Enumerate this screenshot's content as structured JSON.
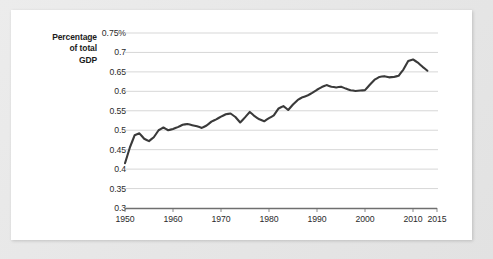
{
  "chart_data": {
    "type": "line",
    "title": "",
    "xlabel": "",
    "ylabel": "Percentage of total GDP",
    "ylabel_lines": [
      "Percentage",
      "of total",
      "GDP"
    ],
    "grid": true,
    "legend": "none",
    "xlim": [
      1950,
      2015
    ],
    "ylim": [
      0.3,
      0.75
    ],
    "x_ticks": [
      1950,
      1960,
      1970,
      1980,
      1990,
      2000,
      2010,
      2015
    ],
    "x_tick_labels": [
      "1950",
      "1960",
      "1970",
      "1980",
      "1990",
      "2000",
      "2010",
      "2015"
    ],
    "y_ticks": [
      0.3,
      0.35,
      0.4,
      0.45,
      0.5,
      0.55,
      0.6,
      0.65,
      0.7,
      0.75
    ],
    "y_tick_labels": [
      "0.3",
      "0.35",
      "0.4",
      "0.45",
      "0.5",
      "0.55",
      "0.6",
      "0.65",
      "0.7",
      "0.75%"
    ],
    "series": [
      {
        "name": "Percentage of total GDP",
        "color": "#3a3a3a",
        "x": [
          1950,
          1951,
          1952,
          1953,
          1954,
          1955,
          1956,
          1957,
          1958,
          1959,
          1960,
          1961,
          1962,
          1963,
          1964,
          1965,
          1966,
          1967,
          1968,
          1969,
          1970,
          1971,
          1972,
          1973,
          1974,
          1975,
          1976,
          1977,
          1978,
          1979,
          1980,
          1981,
          1982,
          1983,
          1984,
          1985,
          1986,
          1987,
          1988,
          1989,
          1990,
          1991,
          1992,
          1993,
          1994,
          1995,
          1996,
          1997,
          1998,
          1999,
          2000,
          2001,
          2002,
          2003,
          2004,
          2005,
          2006,
          2007,
          2008,
          2009,
          2010,
          2011,
          2012,
          2013
        ],
        "values": [
          0.415,
          0.455,
          0.487,
          0.492,
          0.478,
          0.472,
          0.482,
          0.5,
          0.507,
          0.5,
          0.503,
          0.508,
          0.514,
          0.516,
          0.513,
          0.51,
          0.506,
          0.512,
          0.522,
          0.528,
          0.535,
          0.541,
          0.543,
          0.534,
          0.52,
          0.533,
          0.547,
          0.536,
          0.528,
          0.523,
          0.531,
          0.538,
          0.556,
          0.562,
          0.552,
          0.566,
          0.578,
          0.585,
          0.589,
          0.596,
          0.604,
          0.611,
          0.616,
          0.612,
          0.61,
          0.612,
          0.607,
          0.603,
          0.601,
          0.602,
          0.603,
          0.617,
          0.63,
          0.637,
          0.639,
          0.636,
          0.637,
          0.64,
          0.656,
          0.678,
          0.682,
          0.674,
          0.663,
          0.653
        ]
      }
    ]
  },
  "axis": {
    "y_title_line1": "Percentage",
    "y_title_line2": "of total",
    "y_title_line3": "GDP"
  }
}
